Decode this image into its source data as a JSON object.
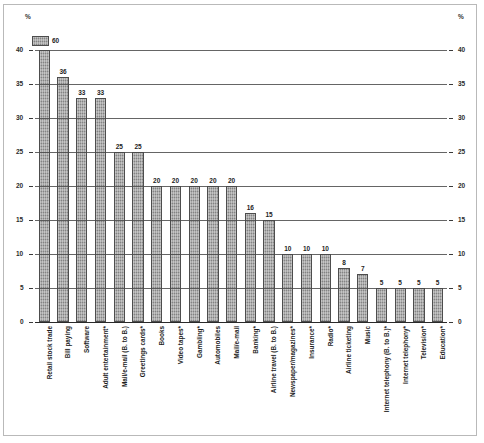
{
  "axis": {
    "unit_left": "%",
    "unit_right": "%",
    "ticks": [
      0,
      5,
      10,
      15,
      20,
      25,
      30,
      35,
      40
    ]
  },
  "legend": {
    "value": "60",
    "swatch_name": "bar-fill-swatch"
  },
  "chart_data": {
    "type": "bar",
    "title": "",
    "subtitle": "",
    "xlabel": "",
    "ylabel": "%",
    "ylim": [
      0,
      40
    ],
    "grid": true,
    "legend_position": "top-left",
    "annotations": [
      "Leading bar value 60 shown in top-left swatch; bar is clipped at axis maximum of 40"
    ],
    "categories": [
      "Retail stock trade",
      "Bill paying",
      "Software",
      "Adult entertainment*",
      "Mail/e-mail (B. to B.)",
      "Greetings cards*",
      "Books",
      "Video tapes*",
      "Gambling*",
      "Automobiles",
      "Mail/e-mail",
      "Banking*",
      "Airline travel (B. to B.)",
      "Newspaper/magazines*",
      "Insurance*",
      "Radio*",
      "Airline ticketing",
      "Music",
      "Internet telephony (B. to B.)*",
      "Internet telephony*",
      "Television*",
      "Education*"
    ],
    "values": [
      60,
      36,
      33,
      33,
      25,
      25,
      20,
      20,
      20,
      20,
      20,
      16,
      15,
      10,
      10,
      10,
      8,
      7,
      5,
      5,
      5,
      5
    ],
    "value_labels": [
      "60",
      "36",
      "33",
      "33",
      "25",
      "25",
      "20",
      "20",
      "20",
      "20",
      "20",
      "16",
      "15",
      "10",
      "10",
      "10",
      "8",
      "7",
      "5",
      "5",
      "5",
      "5"
    ]
  }
}
